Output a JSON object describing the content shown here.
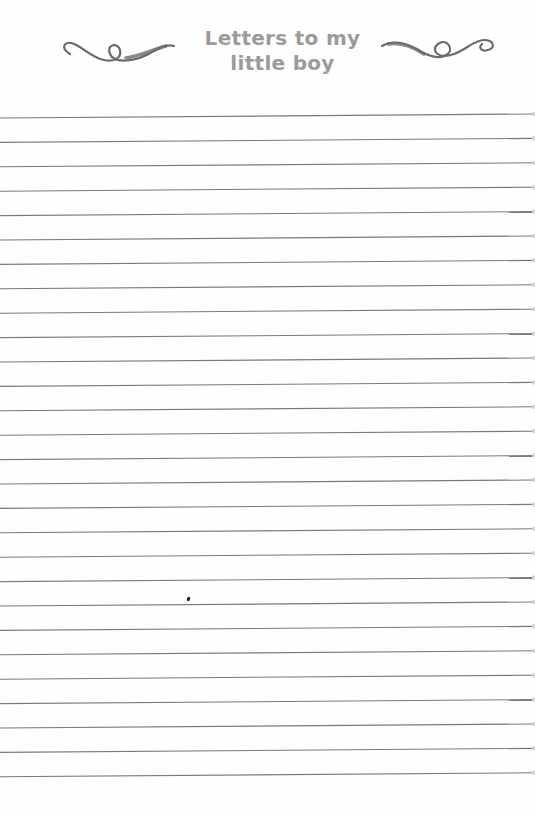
{
  "header": {
    "title_line_1": "Letters to my",
    "title_line_2": "little boy",
    "title_color": "#9b9b9b",
    "ornament_left": "swirl-flourish",
    "ornament_right": "swirl-flourish",
    "ornament_color": "#6b6b6b"
  },
  "ruled_area": {
    "line_count": 28,
    "first_line_y": 118,
    "line_spacing": 24.4,
    "line_tilt_px": 4,
    "line_color": "#7a7a7a"
  },
  "marks": {
    "ink_speck": {
      "x": 188,
      "y": 599
    }
  }
}
